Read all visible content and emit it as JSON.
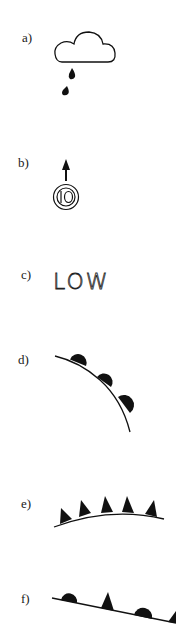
{
  "figure": {
    "items": [
      {
        "label": "a)",
        "symbol": "cloud-with-rain-drops",
        "description": "Cloud outline with two falling rain drops"
      },
      {
        "label": "b)",
        "symbol": "wind-arrow-station",
        "description": "Upward arrow above double circle containing number",
        "station_value": "10"
      },
      {
        "label": "c)",
        "symbol": "low-pressure-text",
        "text": "LOW"
      },
      {
        "label": "d)",
        "symbol": "warm-front",
        "description": "Curved line with three semicircles"
      },
      {
        "label": "e)",
        "symbol": "cold-front",
        "description": "Curved line with five triangles"
      },
      {
        "label": "f)",
        "symbol": "occluded-front",
        "description": "Line with alternating semicircles and triangles"
      }
    ]
  },
  "colors": {
    "ink": "#111111",
    "background": "#ffffff"
  }
}
